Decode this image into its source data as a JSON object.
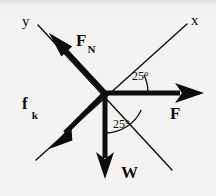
{
  "figure": {
    "kind": "free-body-diagram",
    "background_color": "#f4f3f1",
    "ink_color": "#0d0d0d",
    "width": 216,
    "height": 196,
    "origin": {
      "x": 105,
      "y": 93
    }
  },
  "axes": [
    {
      "name": "y-axis",
      "label": "y",
      "label_pos": {
        "x": 22,
        "y": 14
      },
      "from": {
        "x": 38,
        "y": 25
      },
      "to": {
        "x": 172,
        "y": 170
      },
      "stroke_width": 1.4,
      "tilt_deg_from_vertical": 25
    },
    {
      "name": "x-axis",
      "label": "x",
      "label_pos": {
        "x": 191,
        "y": 13
      },
      "from": {
        "x": 36,
        "y": 160
      },
      "to": {
        "x": 187,
        "y": 24
      },
      "stroke_width": 1.4,
      "tilt_deg_from_horizontal": 25
    }
  ],
  "vectors": [
    {
      "name": "normal-force",
      "label": "F",
      "subscript": "N",
      "label_pos": {
        "x": 76,
        "y": 32
      },
      "from": {
        "x": 105,
        "y": 93
      },
      "to": {
        "x": 50,
        "y": 34
      },
      "stroke_width": 5,
      "head_len": 20,
      "head_half_w": 8
    },
    {
      "name": "kinetic-friction-force",
      "label": "f",
      "subscript": "k",
      "label_pos": {
        "x": 22,
        "y": 95
      },
      "from": {
        "x": 105,
        "y": 93
      },
      "to": {
        "x": 50,
        "y": 148
      },
      "stroke_width": 5,
      "head_len": 20,
      "head_half_w": 8
    },
    {
      "name": "applied-force",
      "label": "F",
      "subscript": "",
      "label_pos": {
        "x": 170,
        "y": 105
      },
      "from": {
        "x": 105,
        "y": 93
      },
      "to": {
        "x": 203,
        "y": 93
      },
      "stroke_width": 5,
      "head_len": 24,
      "head_half_w": 9
    },
    {
      "name": "weight-force",
      "label": "W",
      "subscript": "",
      "label_pos": {
        "x": 121,
        "y": 164
      },
      "from": {
        "x": 105,
        "y": 93
      },
      "to": {
        "x": 105,
        "y": 178
      },
      "stroke_width": 5,
      "head_len": 22,
      "head_half_w": 8
    }
  ],
  "angles": [
    {
      "name": "angle-x-axis-to-applied-force",
      "value": "25°",
      "label_pos": {
        "x": 132,
        "y": 70
      },
      "radius": 43,
      "start_deg": 0,
      "end_deg": 25,
      "between": [
        "applied-force",
        "x-axis"
      ]
    },
    {
      "name": "angle-weight-to-y-axis",
      "value": "25°",
      "label_pos": {
        "x": 113,
        "y": 118
      },
      "radius": 40,
      "start_deg": 65,
      "end_deg": 90,
      "between": [
        "weight-force",
        "y-axis"
      ]
    }
  ]
}
